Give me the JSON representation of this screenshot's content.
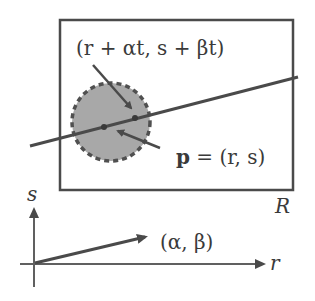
{
  "diagram": {
    "colors": {
      "stroke": "#4a4a4a",
      "disk_fill": "#a8a8a8",
      "text": "#3a3a3a",
      "background": "#ffffff"
    },
    "labels": {
      "moved_point": "(r + αt, s + βt)",
      "point_bold": "p",
      "point_rest": " = (r, s)",
      "region": "R",
      "direction": "(α, β)",
      "axis_s": "s",
      "axis_r": "r"
    }
  }
}
